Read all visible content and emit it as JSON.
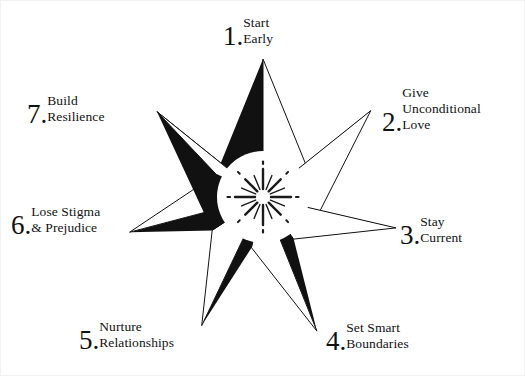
{
  "graphic": {
    "type": "seven-pointed-star-diagram",
    "center_icon": "radiating-burst-icon",
    "colors": {
      "ink": "#111111",
      "fill_black": "#111111",
      "fill_white": "#ffffff",
      "background": "#ffffff",
      "border": "#f2f2f2"
    },
    "star": {
      "points": 7,
      "center_x": 262,
      "center_y": 196,
      "outer_radius": 138,
      "inner_radius": 52,
      "rotation_deg": -90
    },
    "burst": {
      "rays": 24,
      "radius": 30
    }
  },
  "items": [
    {
      "number": "1",
      "lines": [
        "Start",
        "Early"
      ]
    },
    {
      "number": "2",
      "lines": [
        "Give",
        "Unconditional",
        "Love"
      ]
    },
    {
      "number": "3",
      "lines": [
        "Stay",
        "Current"
      ]
    },
    {
      "number": "4",
      "lines": [
        "Set Smart",
        "Boundaries"
      ]
    },
    {
      "number": "5",
      "lines": [
        "Nurture",
        "Relationships"
      ]
    },
    {
      "number": "6",
      "lines": [
        "Lose Stigma",
        "& Prejudice"
      ]
    },
    {
      "number": "7",
      "lines": [
        "Build",
        "Resilience"
      ]
    }
  ],
  "labels": {
    "item1": {
      "num": "1",
      "dot": ".",
      "l1": "Start",
      "l2": "Early",
      "l3": ""
    },
    "item2": {
      "num": "2",
      "dot": ".",
      "l1": "Give",
      "l2": "Unconditional",
      "l3": "Love"
    },
    "item3": {
      "num": "3",
      "dot": ".",
      "l1": "Stay",
      "l2": "Current",
      "l3": ""
    },
    "item4": {
      "num": "4",
      "dot": ".",
      "l1": "Set Smart",
      "l2": "Boundaries",
      "l3": ""
    },
    "item5": {
      "num": "5",
      "dot": ".",
      "l1": "Nurture",
      "l2": "Relationships",
      "l3": ""
    },
    "item6": {
      "num": "6",
      "dot": ".",
      "l1": "Lose Stigma",
      "l2": "& Prejudice",
      "l3": ""
    },
    "item7": {
      "num": "7",
      "dot": ".",
      "l1": "Build",
      "l2": "Resilience",
      "l3": ""
    }
  }
}
